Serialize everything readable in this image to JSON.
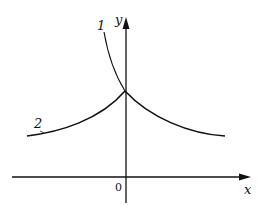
{
  "diagram": {
    "axes": {
      "x_label": "x",
      "y_label": "y",
      "origin_label": "0"
    },
    "curves": [
      {
        "id": "1",
        "label": "1",
        "description": "steep curve approaching y-axis intercept from upper left"
      },
      {
        "id": "2",
        "label": "2",
        "description": "symmetric cusp curve peaking at y-axis, decaying on both sides"
      }
    ],
    "colors": {
      "stroke": "#111111",
      "background": "#ffffff"
    }
  }
}
